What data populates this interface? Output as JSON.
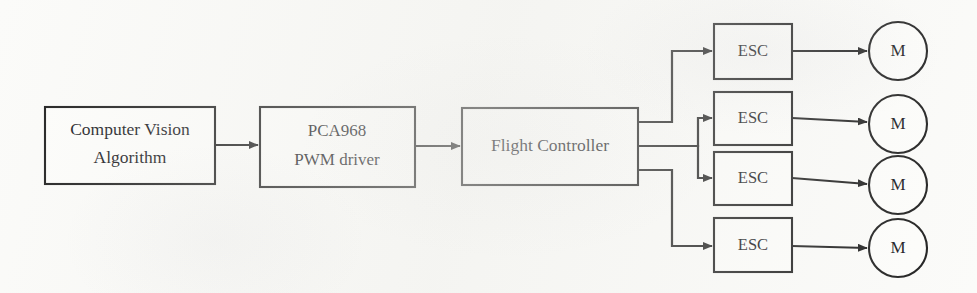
{
  "figure": {
    "type": "block-diagram",
    "background_color": "#fbfbf9",
    "line_color": "#1c1c1c",
    "text_color": "#16161a"
  },
  "nodes": [
    {
      "id": "computer-vision",
      "shape": "rectangle",
      "label_line1": "Computer Vision",
      "label_line2": "Algorithm",
      "x": 45,
      "y": 107,
      "width": 170,
      "height": 77
    },
    {
      "id": "pwm-driver",
      "shape": "rectangle",
      "label_line1": "PCA968",
      "label_line2": "PWM driver",
      "x": 260,
      "y": 107,
      "width": 155,
      "height": 80
    },
    {
      "id": "flight-controller",
      "shape": "rectangle",
      "label_line1": "Flight Controller",
      "label_line2": "",
      "x": 462,
      "y": 108,
      "width": 176,
      "height": 77
    }
  ],
  "esc_blocks": [
    {
      "id": "esc-1",
      "label": "ESC",
      "x": 714,
      "y": 24,
      "width": 78,
      "height": 55
    },
    {
      "id": "esc-2",
      "label": "ESC",
      "x": 714,
      "y": 92,
      "width": 78,
      "height": 53
    },
    {
      "id": "esc-3",
      "label": "ESC",
      "x": 714,
      "y": 152,
      "width": 78,
      "height": 53
    },
    {
      "id": "esc-4",
      "label": "ESC",
      "x": 714,
      "y": 218,
      "width": 78,
      "height": 54
    }
  ],
  "motor_nodes": [
    {
      "id": "motor-1",
      "label": "M",
      "cx": 898,
      "cy": 51,
      "r": 29
    },
    {
      "id": "motor-2",
      "label": "M",
      "cx": 898,
      "cy": 124,
      "r": 29
    },
    {
      "id": "motor-3",
      "label": "M",
      "cx": 898,
      "cy": 185,
      "r": 29
    },
    {
      "id": "motor-4",
      "label": "M",
      "cx": 898,
      "cy": 248,
      "r": 29
    }
  ],
  "connections": [
    {
      "id": "cv-to-pwm",
      "from": "computer-vision",
      "to": "pwm-driver",
      "style": "straight-arrow"
    },
    {
      "id": "pwm-to-fc",
      "from": "pwm-driver",
      "to": "flight-controller",
      "style": "straight-arrow"
    },
    {
      "id": "fc-to-esc1",
      "from": "flight-controller",
      "to": "esc-1",
      "style": "orthogonal-arrow"
    },
    {
      "id": "fc-to-esc2",
      "from": "flight-controller",
      "to": "esc-2",
      "style": "orthogonal-arrow"
    },
    {
      "id": "fc-to-esc3",
      "from": "flight-controller",
      "to": "esc-3",
      "style": "orthogonal-arrow"
    },
    {
      "id": "fc-to-esc4",
      "from": "flight-controller",
      "to": "esc-4",
      "style": "orthogonal-arrow"
    },
    {
      "id": "esc1-to-m1",
      "from": "esc-1",
      "to": "motor-1",
      "style": "straight-arrow"
    },
    {
      "id": "esc2-to-m2",
      "from": "esc-2",
      "to": "motor-2",
      "style": "straight-arrow"
    },
    {
      "id": "esc3-to-m3",
      "from": "esc-3",
      "to": "motor-3",
      "style": "straight-arrow"
    },
    {
      "id": "esc4-to-m4",
      "from": "esc-4",
      "to": "motor-4",
      "style": "straight-arrow"
    }
  ]
}
